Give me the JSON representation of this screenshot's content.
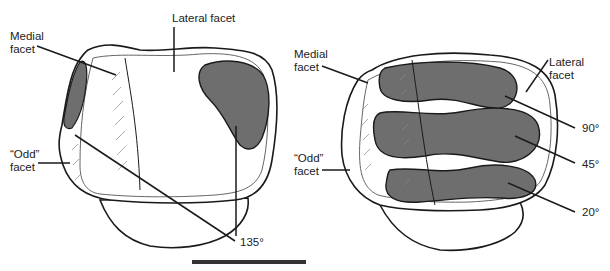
{
  "left_figure": {
    "labels": {
      "medial": "Medial\nfacet",
      "lateral": "Lateral facet",
      "odd": "“Odd”\nfacet",
      "angle": "135°"
    }
  },
  "right_figure": {
    "labels": {
      "medial": "Medial\nfacet",
      "lateral": "Lateral\nfacet",
      "odd": "“Odd”\nfacet",
      "angle_90": "90°",
      "angle_45": "45°",
      "angle_20": "20°"
    }
  },
  "colors": {
    "contact_area": "#6e6e6e",
    "outline": "#1a1a1a",
    "scale_bar": "#333333"
  }
}
